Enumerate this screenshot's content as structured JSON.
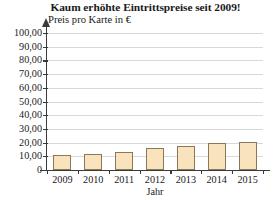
{
  "chart_data": {
    "type": "bar",
    "title": "Kaum erhöhte Eintrittspreise seit 2009!",
    "subtitle": "",
    "xlabel": "Jahr",
    "ylabel": "Preis pro Karte in €",
    "categories": [
      "2009",
      "2010",
      "2011",
      "2012",
      "2013",
      "2014",
      "2015"
    ],
    "values": [
      11.0,
      12.0,
      13.5,
      16.0,
      17.5,
      19.5,
      20.5
    ],
    "ylim": [
      0,
      100
    ],
    "ytick_values": [
      0,
      10,
      20,
      30,
      40,
      50,
      60,
      70,
      80,
      90,
      100
    ],
    "ytick_labels": [
      "0",
      "10,00",
      "20,00",
      "30,00",
      "40,00",
      "50,00",
      "60,00",
      "70,00",
      "80,00",
      "90,00",
      "100,00"
    ],
    "grid": true,
    "grid_axis": "y",
    "legend": false,
    "legend_position": "none",
    "bar_fill_color": "#f9e3bd",
    "bar_border_color": "#8a7856",
    "axis_color": "#3a3a3a",
    "grid_color": "#d8d8d8",
    "y_axis_arrow": true,
    "series": [
      {
        "name": "Preis pro Karte in €",
        "values": [
          11.0,
          12.0,
          13.5,
          16.0,
          17.5,
          19.5,
          20.5
        ]
      }
    ]
  }
}
